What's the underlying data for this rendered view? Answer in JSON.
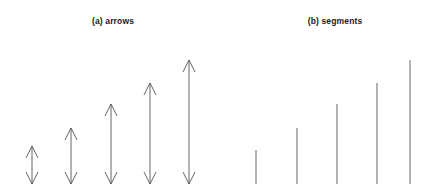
{
  "figure": {
    "width": 443,
    "height": 194,
    "background": "#ffffff",
    "stroke_color": "#555555",
    "stroke_width": 0.9,
    "baseline_y": 184
  },
  "panels": [
    {
      "id": "panel-a",
      "label": "(a) arrows",
      "label_x": 113,
      "label_y": 16
    },
    {
      "id": "panel-b",
      "label": "(b) segments",
      "label_x": 335,
      "label_y": 16
    }
  ],
  "chart_data": {
    "type": "bar",
    "title": "",
    "subtitle": "",
    "xlabel": "",
    "ylabel": "",
    "grid": false,
    "legend": null,
    "axis_visible": false,
    "baseline_y": 184,
    "ylim": [
      0,
      194
    ],
    "categories": [
      "1",
      "2",
      "3",
      "4",
      "5"
    ],
    "series": [
      {
        "name": "(a) arrows",
        "glyph": "double-headed-arrow",
        "x": [
          32,
          71,
          111,
          150,
          189
        ],
        "top_y": [
          146,
          128,
          104,
          83,
          60
        ],
        "bottom_y": [
          184,
          184,
          184,
          184,
          184
        ],
        "values": [
          38,
          56,
          80,
          101,
          124
        ],
        "arrowhead_width": 12,
        "arrowhead_height": 12
      },
      {
        "name": "(b) segments",
        "glyph": "line-segment",
        "x": [
          256,
          297,
          337,
          377,
          410
        ],
        "top_y": [
          150,
          128,
          104,
          83,
          60
        ],
        "bottom_y": [
          184,
          184,
          184,
          184,
          184
        ],
        "values": [
          34,
          56,
          80,
          101,
          124
        ]
      }
    ]
  }
}
